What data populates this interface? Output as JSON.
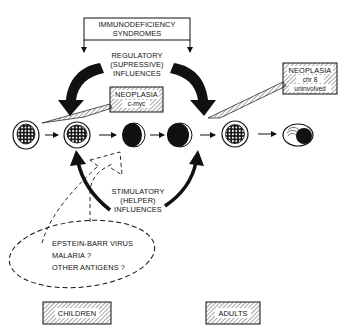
{
  "diagram": {
    "top_box": {
      "line1": "IMMUNODEFICIENCY",
      "line2": "SYNDROMES"
    },
    "regulatory": {
      "line1": "REGULATORY",
      "line2": "(SUPRESSIVE)",
      "line3": "INFLUENCES"
    },
    "stimulatory": {
      "line1": "STIMULATORY",
      "line2": "(HELPER)",
      "line3": "INFLUENCES"
    },
    "neoplasia_children": {
      "line1": "NEOPLASIA",
      "line2": "c-myc"
    },
    "neoplasia_adults": {
      "line1": "NEOPLASIA",
      "line2": "chr 8",
      "line3": "uninvolved"
    },
    "antigens": {
      "line1": "EPSTEIN-BARR VIRUS",
      "line2": "MALARIA ?",
      "line3": "OTHER ANTIGENS ?"
    },
    "groups": {
      "children": "CHILDREN",
      "adults": "ADULTS"
    },
    "cells": [
      {
        "name": "cell-1",
        "type": "nucleated-stippled"
      },
      {
        "name": "cell-2",
        "type": "nucleated-stippled"
      },
      {
        "name": "cell-3",
        "type": "dark-crescent"
      },
      {
        "name": "cell-4",
        "type": "dark-crescent"
      },
      {
        "name": "cell-5",
        "type": "nucleated-stippled"
      },
      {
        "name": "cell-6",
        "type": "plasma-cell"
      }
    ],
    "colors": {
      "ink": "#111111",
      "background": "#ffffff"
    }
  }
}
